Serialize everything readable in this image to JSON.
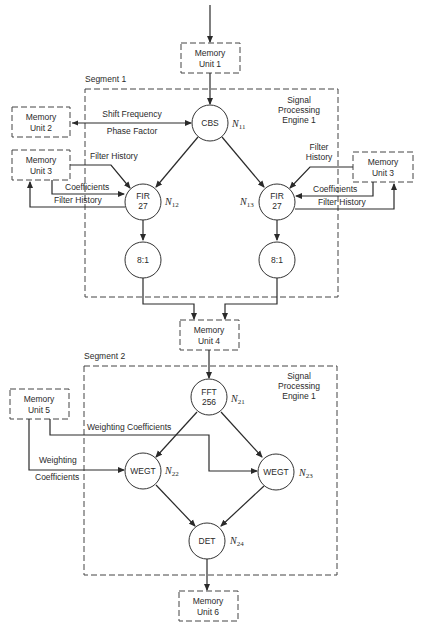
{
  "segments": [
    {
      "label": "Segment 1",
      "engine": [
        "Signal",
        "Processing",
        "Engine 1"
      ]
    },
    {
      "label": "Segment 2",
      "engine": [
        "Signal",
        "Processing",
        "Engine 1"
      ]
    }
  ],
  "memory_units": {
    "mu1": [
      "Memory",
      "Unit 1"
    ],
    "mu2": [
      "Memory",
      "Unit 2"
    ],
    "mu3_left": [
      "Memory",
      "Unit 3"
    ],
    "mu3_right": [
      "Memory",
      "Unit 3"
    ],
    "mu4": [
      "Memory",
      "Unit 4"
    ],
    "mu5": [
      "Memory",
      "Unit 5"
    ],
    "mu6": [
      "Memory",
      "Unit 6"
    ]
  },
  "nodes": {
    "cbs": {
      "lines": [
        "CBS"
      ],
      "id": "N",
      "sub": "11"
    },
    "fir_left": {
      "lines": [
        "FIR",
        "27"
      ],
      "id": "N",
      "sub": "12"
    },
    "fir_right": {
      "lines": [
        "FIR",
        "27"
      ],
      "id": "N",
      "sub": "13"
    },
    "dec_left": {
      "lines": [
        "8:1"
      ]
    },
    "dec_right": {
      "lines": [
        "8:1"
      ]
    },
    "fft": {
      "lines": [
        "FFT",
        "256"
      ],
      "id": "N",
      "sub": "21"
    },
    "wegt_left": {
      "lines": [
        "WEGT"
      ],
      "id": "N",
      "sub": "22"
    },
    "wegt_right": {
      "lines": [
        "WEGT"
      ],
      "id": "N",
      "sub": "23"
    },
    "det": {
      "lines": [
        "DET"
      ],
      "id": "N",
      "sub": "24"
    }
  },
  "edge_labels": {
    "shift_frequency": "Shift Frequency",
    "phase_factor": "Phase Factor",
    "left_filter_history_in": "Filter History",
    "left_coefficients": "Coefficients",
    "left_filter_history_out": "Filter History",
    "right_filter_history_in": [
      "Filter",
      "History"
    ],
    "right_coefficients": "Coefficients",
    "right_filter_history_out": "Filter History",
    "weighting_coefficients_top": "Weighting Coefficients",
    "weighting_left": "Weighting",
    "coefficients_left": "Coefficients"
  }
}
